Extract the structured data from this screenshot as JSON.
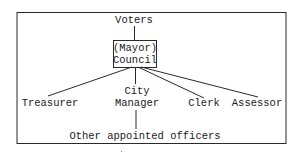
{
  "diagram": {
    "type": "org-chart",
    "title": "",
    "colors": {
      "stroke": "#2a2a2a",
      "text": "#1a1a1a",
      "background": "#ffffff"
    },
    "nodes": {
      "voters": {
        "label": "Voters"
      },
      "council": {
        "line1": "(Mayor)",
        "line2": "Council"
      },
      "treasurer": {
        "label": "Treasurer"
      },
      "city_manager": {
        "line1": "City",
        "line2": "Manager"
      },
      "clerk": {
        "label": "Clerk"
      },
      "assessor": {
        "label": "Assessor"
      },
      "other_officers": {
        "label": "Other appointed officers"
      }
    },
    "edges": [
      {
        "from": "voters",
        "to": "council"
      },
      {
        "from": "council",
        "to": "treasurer"
      },
      {
        "from": "council",
        "to": "city_manager"
      },
      {
        "from": "council",
        "to": "clerk"
      },
      {
        "from": "council",
        "to": "assessor"
      },
      {
        "from": "city_manager",
        "to": "other_officers"
      }
    ]
  }
}
